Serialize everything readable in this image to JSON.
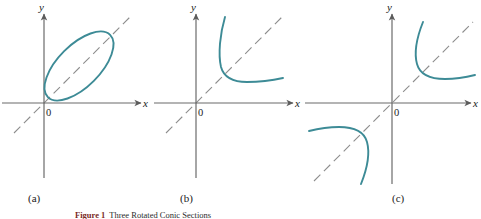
{
  "figure": {
    "caption_number": "Figure 1",
    "caption_text": "Three Rotated Conic Sections",
    "colors": {
      "curve": "#3d8b96",
      "axis": "#6b6b6b",
      "dashed_axis": "#8a8a8a",
      "text": "#1a1a1a",
      "caption_number": "#7a2b1f"
    }
  },
  "panels": [
    {
      "id": "a",
      "label": "(a)",
      "conic": "ellipse",
      "x_axis_label": "x",
      "y_axis_label": "y",
      "origin_label": "0",
      "rotation_axis": "dashed line at 45 degrees through origin",
      "description": "Rotated ellipse with major axis along the 45 degree dashed line, lying in the first quadrant"
    },
    {
      "id": "b",
      "label": "(b)",
      "conic": "parabola",
      "x_axis_label": "x",
      "y_axis_label": "y",
      "origin_label": "0",
      "rotation_axis": "dashed line at 45 degrees through origin",
      "description": "Rotated parabola opening up and to the right, vertex on the 45 degree dashed line in the first quadrant"
    },
    {
      "id": "c",
      "label": "(c)",
      "conic": "hyperbola",
      "x_axis_label": "x",
      "y_axis_label": "y",
      "origin_label": "0",
      "rotation_axis": "dashed line at 45 degrees through origin",
      "description": "Rotated hyperbola with two branches, one in the first quadrant and one in the third quadrant, symmetric about the 45 degree dashed line"
    }
  ]
}
